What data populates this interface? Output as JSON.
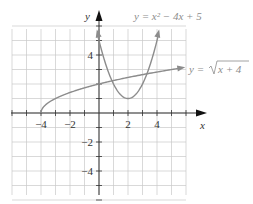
{
  "chart_data": {
    "type": "line",
    "title": "",
    "xlabel": "x",
    "ylabel": "y",
    "xlim": [
      -6,
      6
    ],
    "ylim": [
      -6,
      6
    ],
    "grid": true,
    "x_ticks": [
      -4,
      -2,
      2,
      4
    ],
    "x_tick_labels": [
      "−4",
      "−2",
      "2",
      "4"
    ],
    "y_ticks": [
      4,
      -2,
      -4
    ],
    "y_tick_labels": [
      "4",
      "−2",
      "−4"
    ],
    "series": [
      {
        "name": "y = x^2 − 4x + 5",
        "label": "y = x² − 4x + 5",
        "function": "x^2 - 4x + 5",
        "domain": [
          -0.1,
          4.1
        ],
        "x": [
          0,
          1,
          2,
          3,
          4
        ],
        "values": [
          5,
          2,
          1,
          2,
          5
        ],
        "arrows": "both-ends",
        "color": "#8c8c8c"
      },
      {
        "name": "y = sqrt(x + 4)",
        "label": "y = √(x + 4)",
        "function": "sqrt(x + 4)",
        "domain": [
          -4,
          5.8
        ],
        "x": [
          -4,
          -3,
          0,
          5
        ],
        "values": [
          0,
          1,
          2,
          3
        ],
        "endpoint": "closed at (-4, 0)",
        "arrows": "right-end",
        "color": "#8c8c8c"
      }
    ],
    "legend_position": "inline annotations at top-right"
  },
  "labels": {
    "x_axis": "x",
    "y_axis": "y",
    "parabola_eq": "y = x² − 4x + 5",
    "sqrt_eq_prefix": "y = ",
    "sqrt_eq_radicand": "x + 4"
  },
  "colors": {
    "grid": "#c8c8c8",
    "axes": "#333333",
    "curve": "#8c8c8c",
    "label": "#8c8c8c"
  }
}
